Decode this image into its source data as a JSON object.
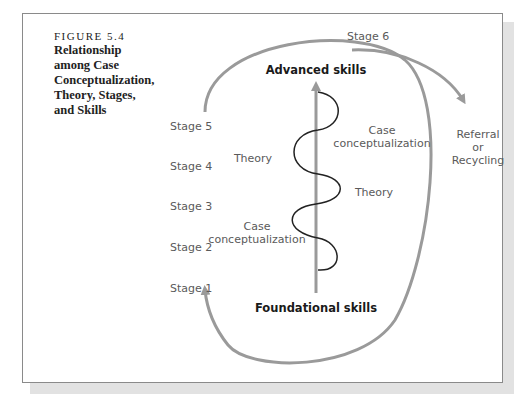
{
  "figure": {
    "number": "FIGURE 5.4",
    "title": "Relationship\namong Case\nConceptualization,\nTheory, Stages,\nand Skills"
  },
  "stages": [
    "Stage 1",
    "Stage 2",
    "Stage 3",
    "Stage 4",
    "Stage 5",
    "Stage 6"
  ],
  "skills_axis": {
    "top": "Advanced skills",
    "bottom": "Foundational skills"
  },
  "spiral_labels": [
    {
      "line1": "Case",
      "line2": "conceptualization"
    },
    {
      "line1": "Theory"
    },
    {
      "line1": "Theory"
    },
    {
      "line1": "Case",
      "line2": "conceptualization"
    }
  ],
  "exit": {
    "line1": "Referral",
    "line2": "or",
    "line3": "Recycling"
  },
  "colors": {
    "arrow_gray": "#9a9a9a",
    "spiral": "#222222",
    "frame": "#8a8a8a",
    "shadow": "#e2e2e2"
  }
}
